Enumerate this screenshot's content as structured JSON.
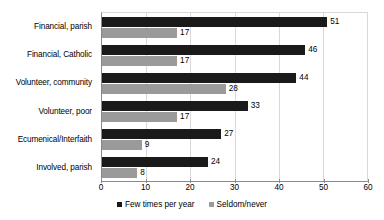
{
  "chart_data": {
    "type": "bar",
    "orientation": "horizontal",
    "title": "",
    "xlabel": "",
    "ylabel": "",
    "xlim": [
      0,
      60
    ],
    "xticks": [
      0,
      10,
      20,
      30,
      40,
      50,
      60
    ],
    "grid": true,
    "legend_position": "bottom",
    "categories": [
      "Financial, parish",
      "Financial, Catholic",
      "Volunteer, community",
      "Volunteer, poor",
      "Ecumenical/Interfaith",
      "Involved, parish"
    ],
    "series": [
      {
        "name": "Few times per year",
        "color": "#1a1a1a",
        "values": [
          51,
          46,
          44,
          33,
          27,
          24
        ]
      },
      {
        "name": "Seldom/never",
        "color": "#9a9a9a",
        "values": [
          17,
          17,
          28,
          17,
          9,
          8
        ]
      }
    ]
  }
}
